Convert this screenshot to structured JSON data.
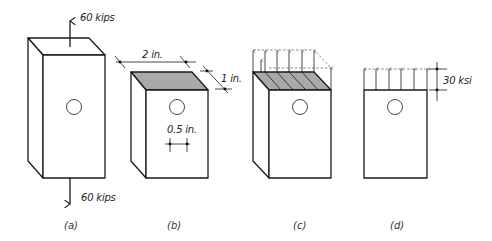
{
  "figure": {
    "panel_a": {
      "caption": "(a)",
      "top_force_label": "60 kips",
      "bottom_force_label": "60 kips"
    },
    "panel_b": {
      "caption": "(b)",
      "width_label": "2 in.",
      "depth_label": "1 in.",
      "hole_diameter_label": "0.5 in."
    },
    "panel_c": {
      "caption": "(c)"
    },
    "panel_d": {
      "caption": "(d)",
      "stress_label": "30 ksi"
    }
  },
  "colors": {
    "line": "#1a1a1a",
    "shaded_face": "#a9a9a9",
    "background": "#ffffff"
  }
}
